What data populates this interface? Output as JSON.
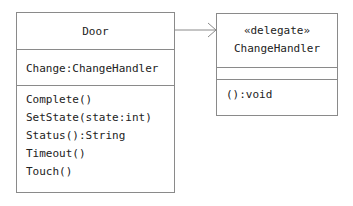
{
  "diagram": {
    "type": "uml-class-diagram",
    "classes": [
      {
        "id": "door",
        "name": "Door",
        "attributes": [
          "Change:ChangeHandler"
        ],
        "operations": [
          "Complete()",
          "SetState(state:int)",
          "Status():String",
          "Timeout()",
          "Touch()"
        ]
      },
      {
        "id": "changehandler",
        "stereotype": "«delegate»",
        "name": "ChangeHandler",
        "attributes": [],
        "operations": [
          "():void"
        ]
      }
    ],
    "relationships": [
      {
        "from": "Door",
        "to": "ChangeHandler",
        "kind": "association-navigable",
        "arrowhead": "open"
      }
    ],
    "colors": {
      "line": "#8a8a8a",
      "text": "#222222",
      "background": "#ffffff"
    }
  }
}
